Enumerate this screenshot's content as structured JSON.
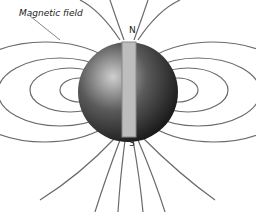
{
  "diagram": {
    "title": "Magnetic field",
    "north_label": "N",
    "south_label": "S",
    "colors": {
      "lines": "#6a6a6a",
      "globe_dark": "#1c1c1c",
      "globe_light": "#d8d8d8",
      "magnet": "#bdbdbd"
    }
  }
}
